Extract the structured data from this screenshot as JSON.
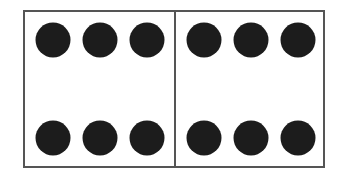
{
  "figure": {
    "panels": [
      {
        "name": "left",
        "rows": 2,
        "dots_per_row": 3,
        "dot_count": 6
      },
      {
        "name": "right",
        "rows": 2,
        "dots_per_row": 3,
        "dot_count": 6
      }
    ],
    "total_dots": 12,
    "colors": {
      "border": "#555555",
      "dot": "#1c1c1c",
      "background": "#ffffff"
    }
  }
}
